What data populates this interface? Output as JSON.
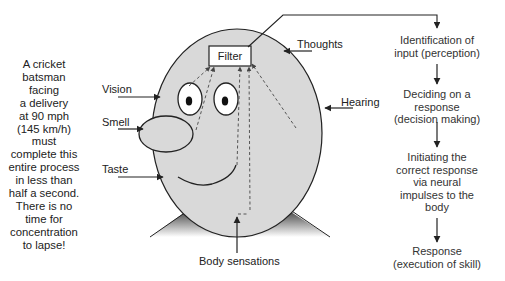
{
  "side_note": "A cricket batsman facing a delivery at 90 mph (145 km/h) must complete this entire process in less than half a second. There is no time for concentration to lapse!",
  "side_note_lines": [
    "A cricket",
    "batsman",
    "facing",
    "a delivery",
    "at 90 mph",
    "(145 km/h)",
    "must",
    "complete this",
    "entire process",
    "in less than",
    "half a second.",
    "There is no",
    "time for",
    "concentration",
    "to lapse!"
  ],
  "head": {
    "filter_label": "Filter",
    "inputs": {
      "vision": "Vision",
      "smell": "Smell",
      "taste": "Taste",
      "thoughts": "Thoughts",
      "hearing": "Hearing",
      "body": "Body sensations"
    }
  },
  "flow": {
    "steps": [
      {
        "line1": "Identification of",
        "line2": "input (perception)",
        "line3": ""
      },
      {
        "line1": "Deciding on a",
        "line2": "response",
        "line3": "(decision making)"
      },
      {
        "line1": "Initiating the",
        "line2": "correct response",
        "line3": "via neural",
        "line4": "impulses to the",
        "line5": "body"
      },
      {
        "line1": "Response",
        "line2": "(execution of skill)",
        "line3": ""
      }
    ]
  },
  "colors": {
    "head_fill": "#d9d9d9",
    "stroke": "#222222",
    "shoulder_dark": "#2a2a2a",
    "shoulder_light": "#ffffff"
  }
}
